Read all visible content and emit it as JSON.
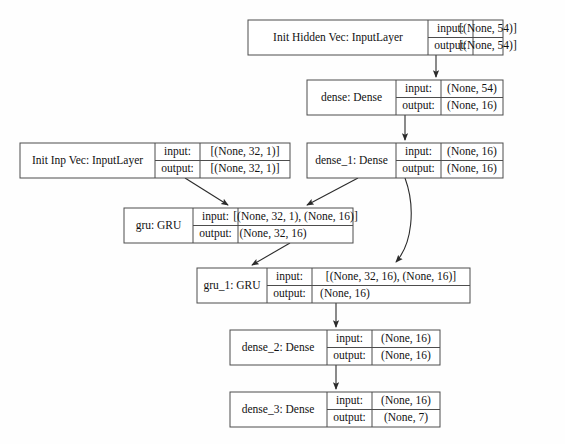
{
  "diagram": {
    "kind": "keras-model-plot",
    "background_color": "#fefefe",
    "box_stroke_color": "#4d4d4d",
    "edge_color": "#2b2b2b",
    "text_color": "#111111",
    "io_row_labels": {
      "input": "input:",
      "output": "output:"
    },
    "nodes": [
      {
        "id": "init_hidden_vec",
        "name": "Init Hidden Vec: InputLayer",
        "input": "[(None, 54)]",
        "output": "[(None, 54)]",
        "merged_output": false
      },
      {
        "id": "dense",
        "name": "dense: Dense",
        "input": "(None, 54)",
        "output": "(None, 16)",
        "merged_output": false
      },
      {
        "id": "init_inp_vec",
        "name": "Init Inp Vec: InputLayer",
        "input": "[(None, 32, 1)]",
        "output": "[(None, 32, 1)]",
        "merged_output": false
      },
      {
        "id": "dense_1",
        "name": "dense_1: Dense",
        "input": "(None, 16)",
        "output": "(None, 16)",
        "merged_output": false
      },
      {
        "id": "gru",
        "name": "gru: GRU",
        "input": "[(None, 32, 1), (None, 16)]",
        "output": "(None, 32, 16)",
        "merged_output": true
      },
      {
        "id": "gru_1",
        "name": "gru_1: GRU",
        "input": "[(None, 32, 16), (None, 16)]",
        "output": "(None, 16)",
        "merged_output": true
      },
      {
        "id": "dense_2",
        "name": "dense_2: Dense",
        "input": "(None, 16)",
        "output": "(None, 16)",
        "merged_output": false
      },
      {
        "id": "dense_3",
        "name": "dense_3: Dense",
        "input": "(None, 16)",
        "output": "(None, 7)",
        "merged_output": false
      }
    ],
    "edges": [
      {
        "from": "init_hidden_vec",
        "to": "dense"
      },
      {
        "from": "dense",
        "to": "dense_1"
      },
      {
        "from": "init_inp_vec",
        "to": "gru"
      },
      {
        "from": "dense_1",
        "to": "gru"
      },
      {
        "from": "dense_1",
        "to": "gru_1"
      },
      {
        "from": "gru",
        "to": "gru_1"
      },
      {
        "from": "gru_1",
        "to": "dense_2"
      },
      {
        "from": "dense_2",
        "to": "dense_3"
      }
    ]
  }
}
